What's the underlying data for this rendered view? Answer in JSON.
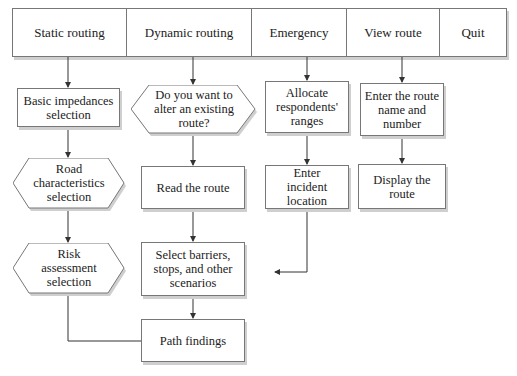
{
  "menu": {
    "items": [
      {
        "label": "Static routing"
      },
      {
        "label": "Dynamic routing"
      },
      {
        "label": "Emergency"
      },
      {
        "label": "View route"
      },
      {
        "label": "Quit"
      }
    ]
  },
  "static": {
    "basic_impedances": "Basic impedances selection",
    "road_characteristics": "Road characteristics selection",
    "risk_assessment": "Risk assessment selection"
  },
  "dynamic": {
    "alter_question": "Do you want to alter an existing route?",
    "read_route": "Read the route",
    "select_barriers": "Select barriers, stops, and other scenarios",
    "path_findings": "Path findings"
  },
  "emergency": {
    "allocate": "Allocate respondents' ranges",
    "enter_incident": "Enter incident location"
  },
  "view": {
    "enter_route": "Enter the route name and number",
    "display_route": "Display the route"
  },
  "colors": {
    "stroke": "#777777",
    "shadow": "#cfcfcf",
    "text": "#222222"
  }
}
